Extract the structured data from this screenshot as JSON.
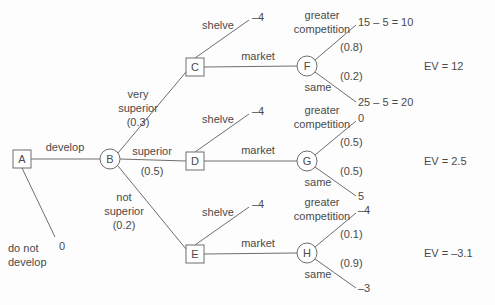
{
  "diagram": {
    "type": "decision-tree",
    "title": "",
    "nodes": [
      {
        "id": "A",
        "label": "A",
        "shape": "square",
        "kind": "decision",
        "x": 22,
        "y": 159
      },
      {
        "id": "B",
        "label": "B",
        "shape": "circle",
        "kind": "chance",
        "x": 110,
        "y": 159
      },
      {
        "id": "C",
        "label": "C",
        "shape": "square",
        "kind": "decision",
        "x": 195,
        "y": 67
      },
      {
        "id": "D",
        "label": "D",
        "shape": "square",
        "kind": "decision",
        "x": 195,
        "y": 161
      },
      {
        "id": "E",
        "label": "E",
        "shape": "square",
        "kind": "decision",
        "x": 195,
        "y": 254
      },
      {
        "id": "F",
        "label": "F",
        "shape": "circle",
        "kind": "chance",
        "x": 307,
        "y": 66
      },
      {
        "id": "G",
        "label": "G",
        "shape": "circle",
        "kind": "chance",
        "x": 307,
        "y": 161
      },
      {
        "id": "H",
        "label": "H",
        "shape": "circle",
        "kind": "chance",
        "x": 307,
        "y": 253
      }
    ],
    "edge_labels": {
      "develop": "develop",
      "do_not_develop_line1": "do not",
      "do_not_develop_line2": "develop",
      "do_not_develop_payoff": "0",
      "very_superior_line1": "very",
      "very_superior_line2": "superior",
      "very_superior_prob": "(0.3)",
      "superior": "superior",
      "superior_prob": "(0.5)",
      "not_superior_line1": "not",
      "not_superior_line2": "superior",
      "not_superior_prob": "(0.2)",
      "shelve": "shelve",
      "shelve_payoff": "–4",
      "market": "market",
      "greater_line1": "greater",
      "greater_line2": "competition",
      "same": "same"
    },
    "branches": [
      {
        "node": "C",
        "shelve_label": "shelve",
        "shelve_payoff": "–4",
        "market_label": "market",
        "chance_node": "F",
        "greater_label_line1": "greater",
        "greater_label_line2": "competition",
        "greater_prob": "(0.8)",
        "greater_payoff": "15 – 5 = 10",
        "same_label": "same",
        "same_prob": "(0.2)",
        "same_payoff": "25 – 5 = 20",
        "ev": "EV = 12"
      },
      {
        "node": "D",
        "shelve_label": "shelve",
        "shelve_payoff": "–4",
        "market_label": "market",
        "chance_node": "G",
        "greater_label_line1": "greater",
        "greater_label_line2": "competition",
        "greater_prob": "(0.5)",
        "greater_payoff": "0",
        "same_label": "same",
        "same_prob": "(0.5)",
        "same_payoff": "5",
        "ev": "EV = 2.5"
      },
      {
        "node": "E",
        "shelve_label": "shelve",
        "shelve_payoff": "–4",
        "market_label": "market",
        "chance_node": "H",
        "greater_label_line1": "greater",
        "greater_label_line2": "competition",
        "greater_prob": "(0.1)",
        "greater_payoff": "–4",
        "same_label": "same",
        "same_prob": "(0.9)",
        "same_payoff": "–3",
        "ev": "EV = –3.1"
      }
    ],
    "colors": {
      "stroke": "#6e6e6e",
      "text": "#4a4a4a",
      "background": "#fdfdfd"
    }
  }
}
